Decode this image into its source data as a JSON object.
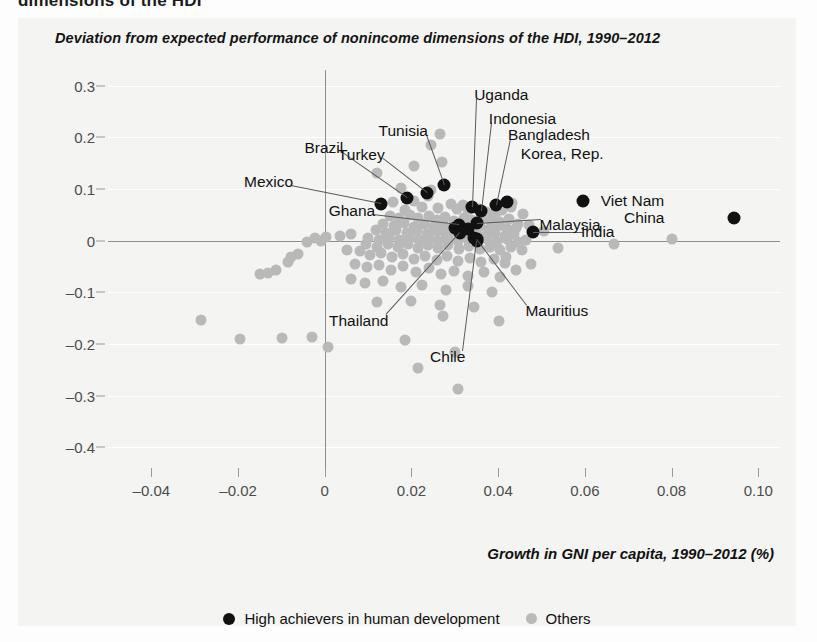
{
  "page": {
    "cut_off_heading": "dimensions of the HDI"
  },
  "figure": {
    "title": "Deviation from expected performance of nonincome dimensions of the HDI, 1990–2012",
    "xaxis_title": "Growth in GNI per capita, 1990–2012 (%)"
  },
  "legend": {
    "items": [
      {
        "label": "High achievers in human development",
        "marker": "black-dot",
        "color": "#111111"
      },
      {
        "label": "Others",
        "marker": "gray-dot",
        "color": "#b9b9b9"
      }
    ]
  },
  "chart_data": {
    "type": "scatter",
    "title": "Deviation from expected performance of nonincome dimensions of the HDI, 1990–2012",
    "xlabel": "Growth in GNI per capita, 1990–2012 (%)",
    "ylabel": "",
    "xlim": [
      -0.05,
      0.105
    ],
    "ylim": [
      -0.44,
      0.33
    ],
    "xticks": [
      -0.04,
      -0.02,
      0,
      0.02,
      0.04,
      0.06,
      0.08,
      0.1
    ],
    "xticklabels": [
      "–0.04",
      "–0.02",
      "0",
      "0.02",
      "0.04",
      "0.06",
      "0.08",
      "0.10"
    ],
    "yticks": [
      0.3,
      0.2,
      0.1,
      0,
      -0.1,
      -0.2,
      -0.3,
      -0.4
    ],
    "yticklabels": [
      "0.3",
      "0.2",
      "0.1",
      "0",
      "–0.1",
      "–0.2",
      "–0.3",
      "–0.4"
    ],
    "grid": "horizontal",
    "legend_position": "bottom-center",
    "zero_lines": {
      "x": 0,
      "y": 0
    },
    "series": [
      {
        "name": "High achievers in human development",
        "color": "#111111",
        "points": [
          {
            "label": "Mexico",
            "x": 0.013,
            "y": 0.07,
            "label_dx": -88,
            "label_dy": -22,
            "leader": true
          },
          {
            "label": "Brazil",
            "x": 0.019,
            "y": 0.083,
            "label_dx": -64,
            "label_dy": -50,
            "leader": true
          },
          {
            "label": "Turkey",
            "x": 0.0235,
            "y": 0.093,
            "label_dx": -42,
            "label_dy": -38,
            "leader": true
          },
          {
            "label": "Tunisia",
            "x": 0.0275,
            "y": 0.107,
            "label_dx": -16,
            "label_dy": -54,
            "leader": true
          },
          {
            "label": "Ghana",
            "x": 0.031,
            "y": 0.031,
            "label_dx": -84,
            "label_dy": -14,
            "leader": true
          },
          {
            "label": "Uganda",
            "x": 0.034,
            "y": 0.064,
            "label_dx": 2,
            "label_dy": -112,
            "leader": true
          },
          {
            "label": "Indonesia",
            "x": 0.036,
            "y": 0.057,
            "label_dx": 8,
            "label_dy": -92,
            "leader": true
          },
          {
            "label": "Bangladesh",
            "x": 0.0395,
            "y": 0.068,
            "label_dx": 12,
            "label_dy": -70,
            "leader": true
          },
          {
            "label": "Korea, Rep.",
            "x": 0.042,
            "y": 0.074,
            "label_dx": 14,
            "label_dy": -48,
            "leader": false
          },
          {
            "label": "Malaysia",
            "x": 0.0352,
            "y": 0.0345,
            "label_dx": 62,
            "label_dy": 2,
            "leader": true
          },
          {
            "label": "India",
            "x": 0.048,
            "y": 0.016,
            "label_dx": 48,
            "label_dy": 0,
            "leader": true
          },
          {
            "label": "Viet Nam",
            "x": 0.0595,
            "y": 0.076,
            "label_dx": 18,
            "label_dy": 0,
            "leader": false
          },
          {
            "label": "China",
            "x": 0.0945,
            "y": 0.043,
            "label_dx": -70,
            "label_dy": 0,
            "leader": false
          },
          {
            "label": "Thailand",
            "x": 0.0313,
            "y": 0.0145,
            "label_dx": -72,
            "label_dy": 88,
            "leader": true
          },
          {
            "label": "Chile",
            "x": 0.0352,
            "y": 0.0,
            "label_dx": -12,
            "label_dy": 116,
            "leader": true
          },
          {
            "label": "Mauritius",
            "x": 0.0352,
            "y": 0.0035,
            "label_dx": 48,
            "label_dy": 72,
            "leader": true
          }
        ],
        "unlabeled_points": [
          {
            "x": 0.033,
            "y": 0.023
          },
          {
            "x": 0.03,
            "y": 0.025
          },
          {
            "x": 0.0345,
            "y": 0.0045
          }
        ]
      },
      {
        "name": "Others",
        "color": "#b9b9b9",
        "points": [
          {
            "x": 0.0245,
            "y": 0.185
          },
          {
            "x": 0.0265,
            "y": 0.206
          },
          {
            "x": 0.0205,
            "y": 0.144
          },
          {
            "x": 0.027,
            "y": 0.152
          },
          {
            "x": 0.012,
            "y": 0.13
          },
          {
            "x": 0.0175,
            "y": 0.101
          },
          {
            "x": 0.0245,
            "y": 0.0985
          },
          {
            "x": 0.0238,
            "y": 0.087
          },
          {
            "x": 0.0205,
            "y": 0.076
          },
          {
            "x": 0.0158,
            "y": 0.074
          },
          {
            "x": 0.0185,
            "y": 0.06
          },
          {
            "x": 0.0225,
            "y": 0.064
          },
          {
            "x": 0.0262,
            "y": 0.0635
          },
          {
            "x": 0.029,
            "y": 0.07
          },
          {
            "x": 0.0305,
            "y": 0.062
          },
          {
            "x": 0.0318,
            "y": 0.069
          },
          {
            "x": 0.033,
            "y": 0.06
          },
          {
            "x": 0.0355,
            "y": 0.0615
          },
          {
            "x": 0.0372,
            "y": 0.056
          },
          {
            "x": 0.0392,
            "y": 0.052
          },
          {
            "x": 0.0408,
            "y": 0.059
          },
          {
            "x": 0.043,
            "y": 0.064
          },
          {
            "x": 0.015,
            "y": 0.048
          },
          {
            "x": 0.0172,
            "y": 0.043
          },
          {
            "x": 0.0196,
            "y": 0.05
          },
          {
            "x": 0.0215,
            "y": 0.043
          },
          {
            "x": 0.024,
            "y": 0.048
          },
          {
            "x": 0.0258,
            "y": 0.04
          },
          {
            "x": 0.0278,
            "y": 0.045
          },
          {
            "x": 0.0298,
            "y": 0.038
          },
          {
            "x": 0.032,
            "y": 0.043
          },
          {
            "x": 0.034,
            "y": 0.039
          },
          {
            "x": 0.0362,
            "y": 0.045
          },
          {
            "x": 0.0382,
            "y": 0.04
          },
          {
            "x": 0.0405,
            "y": 0.035
          },
          {
            "x": 0.0425,
            "y": 0.042
          },
          {
            "x": 0.0445,
            "y": 0.033
          },
          {
            "x": 0.0135,
            "y": 0.033
          },
          {
            "x": 0.016,
            "y": 0.028
          },
          {
            "x": 0.0182,
            "y": 0.034
          },
          {
            "x": 0.0205,
            "y": 0.027
          },
          {
            "x": 0.0228,
            "y": 0.032
          },
          {
            "x": 0.025,
            "y": 0.026
          },
          {
            "x": 0.0272,
            "y": 0.031
          },
          {
            "x": 0.0292,
            "y": 0.025
          },
          {
            "x": 0.0315,
            "y": 0.03
          },
          {
            "x": 0.0338,
            "y": 0.024
          },
          {
            "x": 0.0358,
            "y": 0.029
          },
          {
            "x": 0.0378,
            "y": 0.023
          },
          {
            "x": 0.04,
            "y": 0.028
          },
          {
            "x": 0.042,
            "y": 0.022
          },
          {
            "x": 0.0442,
            "y": 0.025
          },
          {
            "x": 0.0118,
            "y": 0.02
          },
          {
            "x": 0.0142,
            "y": 0.015
          },
          {
            "x": 0.0165,
            "y": 0.021
          },
          {
            "x": 0.019,
            "y": 0.014
          },
          {
            "x": 0.0212,
            "y": 0.019
          },
          {
            "x": 0.0235,
            "y": 0.012
          },
          {
            "x": 0.0258,
            "y": 0.018
          },
          {
            "x": 0.028,
            "y": 0.011
          },
          {
            "x": 0.0302,
            "y": 0.016
          },
          {
            "x": 0.0325,
            "y": 0.01
          },
          {
            "x": 0.0348,
            "y": 0.015
          },
          {
            "x": 0.037,
            "y": 0.009
          },
          {
            "x": 0.0392,
            "y": 0.014
          },
          {
            "x": 0.0415,
            "y": 0.008
          },
          {
            "x": 0.0436,
            "y": 0.013
          },
          {
            "x": 0.01,
            "y": 0.005
          },
          {
            "x": 0.0125,
            "y": 0.002
          },
          {
            "x": 0.0148,
            "y": 0.006
          },
          {
            "x": 0.0172,
            "y": 0.001
          },
          {
            "x": 0.0195,
            "y": 0.0055
          },
          {
            "x": 0.0218,
            "y": 0.0005
          },
          {
            "x": 0.024,
            "y": 0.005
          },
          {
            "x": 0.0262,
            "y": 0.0
          },
          {
            "x": 0.0285,
            "y": 0.0045
          },
          {
            "x": 0.0308,
            "y": -0.001
          },
          {
            "x": 0.033,
            "y": 0.004
          },
          {
            "x": 0.0352,
            "y": -0.0015
          },
          {
            "x": 0.0375,
            "y": 0.003
          },
          {
            "x": 0.0398,
            "y": -0.002
          },
          {
            "x": 0.042,
            "y": 0.0025
          },
          {
            "x": 0.0445,
            "y": -0.0025
          },
          {
            "x": 0.0465,
            "y": 0.002
          },
          {
            "x": 0.0095,
            "y": -0.007
          },
          {
            "x": 0.012,
            "y": -0.012
          },
          {
            "x": 0.0145,
            "y": -0.006
          },
          {
            "x": 0.0168,
            "y": -0.013
          },
          {
            "x": 0.0192,
            "y": -0.0075
          },
          {
            "x": 0.0215,
            "y": -0.014
          },
          {
            "x": 0.0238,
            "y": -0.0085
          },
          {
            "x": 0.0262,
            "y": -0.015
          },
          {
            "x": 0.0285,
            "y": -0.0095
          },
          {
            "x": 0.031,
            "y": -0.016
          },
          {
            "x": 0.0332,
            "y": -0.0105
          },
          {
            "x": 0.0358,
            "y": -0.017
          },
          {
            "x": 0.038,
            "y": -0.0115
          },
          {
            "x": 0.0405,
            "y": -0.018
          },
          {
            "x": 0.043,
            "y": -0.0125
          },
          {
            "x": 0.0455,
            "y": -0.019
          },
          {
            "x": 0.0082,
            "y": -0.021
          },
          {
            "x": 0.0105,
            "y": -0.028
          },
          {
            "x": 0.013,
            "y": -0.024
          },
          {
            "x": 0.0155,
            "y": -0.032
          },
          {
            "x": 0.018,
            "y": -0.026
          },
          {
            "x": 0.0205,
            "y": -0.035
          },
          {
            "x": 0.0232,
            "y": -0.029
          },
          {
            "x": 0.0258,
            "y": -0.038
          },
          {
            "x": 0.0282,
            "y": -0.03
          },
          {
            "x": 0.0308,
            "y": -0.04
          },
          {
            "x": 0.0335,
            "y": -0.033
          },
          {
            "x": 0.036,
            "y": -0.042
          },
          {
            "x": 0.039,
            "y": -0.035
          },
          {
            "x": 0.0415,
            "y": -0.044
          },
          {
            "x": 0.007,
            "y": -0.046
          },
          {
            "x": 0.0098,
            "y": -0.052
          },
          {
            "x": 0.0125,
            "y": -0.048
          },
          {
            "x": 0.0152,
            "y": -0.056
          },
          {
            "x": 0.018,
            "y": -0.05
          },
          {
            "x": 0.021,
            "y": -0.06
          },
          {
            "x": 0.024,
            "y": -0.054
          },
          {
            "x": 0.0268,
            "y": -0.064
          },
          {
            "x": 0.0298,
            "y": -0.058
          },
          {
            "x": 0.033,
            "y": -0.068
          },
          {
            "x": 0.0368,
            "y": -0.061
          },
          {
            "x": 0.0405,
            "y": -0.07
          },
          {
            "x": 0.0442,
            "y": -0.056
          },
          {
            "x": 0.0475,
            "y": -0.045
          },
          {
            "x": 0.006,
            "y": -0.075
          },
          {
            "x": 0.0092,
            "y": -0.082
          },
          {
            "x": 0.0135,
            "y": -0.078
          },
          {
            "x": 0.0175,
            "y": -0.09
          },
          {
            "x": 0.0225,
            "y": -0.086
          },
          {
            "x": 0.028,
            "y": -0.095
          },
          {
            "x": 0.033,
            "y": -0.088
          },
          {
            "x": 0.0385,
            "y": -0.1
          },
          {
            "x": 0.0198,
            "y": -0.116
          },
          {
            "x": 0.0265,
            "y": -0.125
          },
          {
            "x": 0.012,
            "y": -0.118
          },
          {
            "x": 0.0345,
            "y": -0.129
          },
          {
            "x": 0.0402,
            "y": -0.155
          },
          {
            "x": 0.0272,
            "y": -0.146
          },
          {
            "x": 0.0185,
            "y": -0.192
          },
          {
            "x": 0.03,
            "y": -0.216
          },
          {
            "x": 0.0308,
            "y": -0.288
          },
          {
            "x": 0.0215,
            "y": -0.247
          },
          {
            "x": 0.0002,
            "y": 0.006
          },
          {
            "x": -0.0008,
            "y": 0.0
          },
          {
            "x": -0.0022,
            "y": 0.005
          },
          {
            "x": -0.004,
            "y": -0.003
          },
          {
            "x": -0.0062,
            "y": -0.026
          },
          {
            "x": -0.0078,
            "y": -0.031
          },
          {
            "x": -0.0085,
            "y": -0.042
          },
          {
            "x": -0.0112,
            "y": -0.056
          },
          {
            "x": -0.0132,
            "y": -0.062
          },
          {
            "x": -0.015,
            "y": -0.064
          },
          {
            "x": -0.0285,
            "y": -0.154
          },
          {
            "x": -0.0195,
            "y": -0.19
          },
          {
            "x": -0.0098,
            "y": -0.189
          },
          {
            "x": -0.003,
            "y": -0.187
          },
          {
            "x": 0.0008,
            "y": -0.206
          },
          {
            "x": 0.0052,
            "y": -0.018
          },
          {
            "x": 0.006,
            "y": 0.012
          },
          {
            "x": 0.0035,
            "y": 0.009
          },
          {
            "x": 0.0458,
            "y": 0.052
          },
          {
            "x": 0.0472,
            "y": 0.03
          },
          {
            "x": 0.0505,
            "y": 0.018
          },
          {
            "x": 0.0538,
            "y": -0.015
          },
          {
            "x": 0.08,
            "y": 0.004
          },
          {
            "x": 0.0668,
            "y": -0.006
          },
          {
            "x": 0.0432,
            "y": 0.072
          },
          {
            "x": 0.0418,
            "y": -0.032
          }
        ]
      }
    ]
  }
}
